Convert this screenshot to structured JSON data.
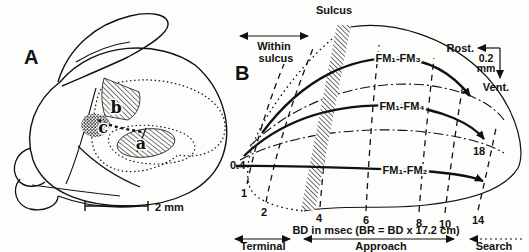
{
  "panelA": {
    "label": "A",
    "region_a": "a",
    "region_b": "b",
    "region_c": "c",
    "scale_bar": "2 mm"
  },
  "panelB": {
    "label": "B",
    "sulcus": "Sulcus",
    "within_sulcus": [
      "Within",
      "sulcus"
    ],
    "orientation": {
      "rostral": "Rost.",
      "ventral": "Vent.",
      "scale_value": "0.2",
      "scale_unit": "mm"
    },
    "subdivision_labels": [
      "FM₁-FM₃",
      "FM₁-FM₄",
      "FM₁-FM₂"
    ],
    "bd_ticks": [
      "0.4",
      "1",
      "2",
      "4",
      "6",
      "8",
      "10",
      "14",
      "18"
    ],
    "axis_label": "BD in msec (BR = BD x 17.2 cm)",
    "phases": [
      "Terminal",
      "Approach",
      "Search"
    ]
  },
  "colors": {
    "ink": "#111111",
    "paper": "#fdfdfb"
  }
}
